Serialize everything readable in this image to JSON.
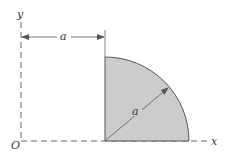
{
  "diagram": {
    "type": "quarter-circle-area",
    "labels": {
      "y_axis": "y",
      "x_axis": "x",
      "origin": "O",
      "offset_dimension": "a",
      "radius_dimension": "a"
    },
    "colors": {
      "fill": "#cccccc",
      "stroke": "#555555",
      "axis": "#666666",
      "background": "#ffffff"
    }
  }
}
